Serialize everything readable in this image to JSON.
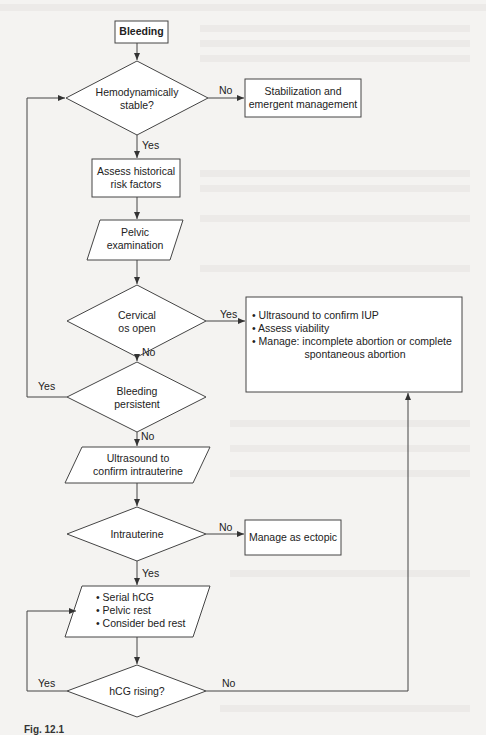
{
  "flowchart": {
    "nodes": {
      "bleeding": "Bleeding",
      "hemodynamically_stable": [
        "Hemodynamically",
        "stable?"
      ],
      "stabilization": [
        "Stabilization and",
        "emergent management"
      ],
      "assess_risk": [
        "Assess historical",
        "risk factors"
      ],
      "pelvic_exam": [
        "Pelvic",
        "examination"
      ],
      "cervical_os": [
        "Cervical",
        "os open"
      ],
      "ultrasound_iup": {
        "bullets": [
          "• Ultrasound to confirm IUP",
          "• Assess viability",
          "• Manage: incomplete abortion or complete"
        ],
        "continuation": "spontaneous abortion"
      },
      "bleeding_persistent": [
        "Bleeding",
        "persistent"
      ],
      "ultrasound_intrauterine": [
        "Ultrasound to",
        "confirm intrauterine"
      ],
      "intrauterine": "Intrauterine",
      "manage_ectopic": "Manage as ectopic",
      "serial_hcg": [
        "• Serial hCG",
        "• Pelvic rest",
        "• Consider bed rest"
      ],
      "hcg_rising": "hCG rising?"
    },
    "edges": {
      "stable_no": "No",
      "stable_yes": "Yes",
      "cervical_yes": "Yes",
      "cervical_no": "No",
      "persistent_yes": "Yes",
      "persistent_no": "No",
      "intrauterine_no": "No",
      "intrauterine_yes": "Yes",
      "hcg_yes": "Yes",
      "hcg_no": "No"
    }
  },
  "caption": "Fig. 12.1"
}
